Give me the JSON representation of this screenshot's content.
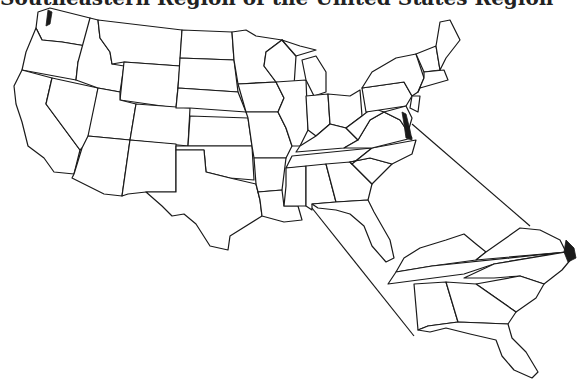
{
  "title": "Southeastern Region of the United States Region",
  "map": {
    "main_map": "Contiguous United States with state boundaries",
    "inset": "Southeastern states enlarged",
    "inset_states": [
      "Kentucky",
      "Virginia",
      "Tennessee",
      "North Carolina",
      "South Carolina",
      "Georgia",
      "Alabama",
      "Florida"
    ],
    "connector_lines": 2,
    "colors": {
      "outline": "#1a1a1a",
      "fill": "#ffffff"
    }
  }
}
